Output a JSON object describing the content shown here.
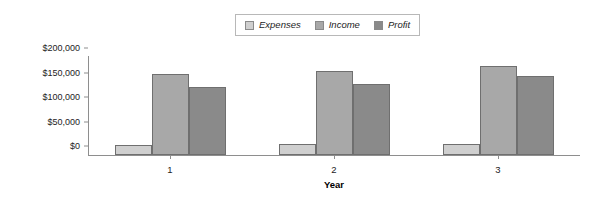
{
  "chart_data": {
    "type": "bar",
    "title": "",
    "xlabel": "Year",
    "ylabel": "",
    "categories": [
      "1",
      "2",
      "3"
    ],
    "series": [
      {
        "name": "Expenses",
        "values": [
          20000,
          22000,
          23000
        ],
        "color": "#cfcfcf"
      },
      {
        "name": "Income",
        "values": [
          165000,
          172000,
          181000
        ],
        "color": "#a8a8a8"
      },
      {
        "name": "Profit",
        "values": [
          139000,
          145000,
          161000
        ],
        "color": "#8a8a8a"
      }
    ],
    "ylim": [
      0,
      200000
    ],
    "ytick_values": [
      0,
      50000,
      100000,
      150000,
      200000
    ],
    "ytick_labels": [
      "$0",
      "$50,000",
      "$100,000",
      "$150,000",
      "$200,000"
    ],
    "grid": false,
    "legend_position": "top-center"
  },
  "legend": {
    "items": [
      {
        "label": "Expenses",
        "color": "#cfcfcf"
      },
      {
        "label": "Income",
        "color": "#a8a8a8"
      },
      {
        "label": "Profit",
        "color": "#8a8a8a"
      }
    ]
  },
  "axes": {
    "x_title": "Year",
    "x_labels": [
      "1",
      "2",
      "3"
    ],
    "y_labels": [
      "$200,000",
      "$150,000",
      "$100,000",
      "$50,000",
      "$0"
    ]
  }
}
